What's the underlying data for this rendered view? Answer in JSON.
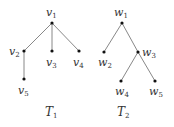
{
  "trees": [
    {
      "name": "T1",
      "caption": {
        "base": "T",
        "sub": "1"
      },
      "nodes": [
        {
          "id": "v1",
          "base": "v",
          "sub": "1",
          "x": 52,
          "y": 23
        },
        {
          "id": "v2",
          "base": "v",
          "sub": "2",
          "x": 24,
          "y": 51
        },
        {
          "id": "v3",
          "base": "v",
          "sub": "3",
          "x": 52,
          "y": 51
        },
        {
          "id": "v4",
          "base": "v",
          "sub": "4",
          "x": 79,
          "y": 51
        },
        {
          "id": "v5",
          "base": "v",
          "sub": "5",
          "x": 24,
          "y": 79
        }
      ],
      "edges": [
        [
          "v1",
          "v2"
        ],
        [
          "v1",
          "v3"
        ],
        [
          "v1",
          "v4"
        ],
        [
          "v2",
          "v5"
        ]
      ]
    },
    {
      "name": "T2",
      "caption": {
        "base": "T",
        "sub": "2"
      },
      "nodes": [
        {
          "id": "w1",
          "base": "w",
          "sub": "1",
          "x": 122,
          "y": 23
        },
        {
          "id": "w2",
          "base": "w",
          "sub": "2",
          "x": 104,
          "y": 52
        },
        {
          "id": "w3",
          "base": "w",
          "sub": "3",
          "x": 138,
          "y": 52
        },
        {
          "id": "w4",
          "base": "w",
          "sub": "4",
          "x": 121,
          "y": 81
        },
        {
          "id": "w5",
          "base": "w",
          "sub": "5",
          "x": 155,
          "y": 81
        }
      ],
      "edges": [
        [
          "w1",
          "w2"
        ],
        [
          "w1",
          "w3"
        ],
        [
          "w3",
          "w4"
        ],
        [
          "w3",
          "w5"
        ]
      ]
    }
  ]
}
